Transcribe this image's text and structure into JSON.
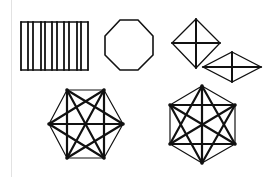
{
  "figure": {
    "stroke_color": "#111111",
    "border_color": "#e2e2e2"
  },
  "shapes": {
    "bars": {
      "x_positions": [
        21,
        28,
        33,
        41,
        45,
        52,
        57,
        64,
        69,
        77,
        81,
        88
      ],
      "top": 22,
      "bottom": 70
    },
    "octagon": {
      "points": "120,20 138,20 153,36 153,55 138,70 120,70 105,55 105,36"
    },
    "diamond_1": {
      "points": "196,19 220,43 196,68 172,43"
    },
    "diamond_2": {
      "points": "232,52 261,67 232,82 203,67"
    },
    "hexagon_1": {
      "vertices": [
        [
          67,
          90
        ],
        [
          104,
          90
        ],
        [
          123,
          124
        ],
        [
          104,
          158
        ],
        [
          67,
          158
        ],
        [
          49,
          124
        ]
      ]
    },
    "hexagon_2": {
      "vertices": [
        [
          202,
          86
        ],
        [
          235,
          105
        ],
        [
          235,
          144
        ],
        [
          202,
          163
        ],
        [
          170,
          144
        ],
        [
          170,
          105
        ]
      ]
    }
  }
}
